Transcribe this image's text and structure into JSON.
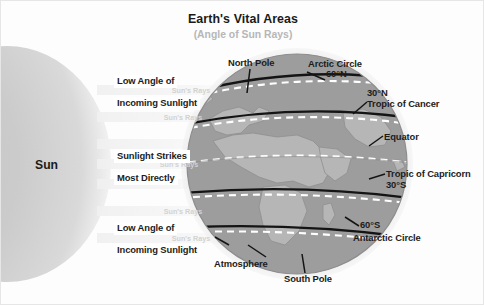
{
  "header": {
    "title": "Earth's Vital Areas",
    "subtitle": "(Angle of Sun Rays)"
  },
  "sun": {
    "label": "Sun"
  },
  "rays": {
    "beam_label_top": "Sun's Rays",
    "beam_label_upper_mid": "Sun's Rays",
    "beam_label_mid": "Sun's Rays",
    "beam_label_lower_mid": "Sun's Rays",
    "beam_label_bottom": "Sun's Rays"
  },
  "left_labels": {
    "top_line1": "Low Angle of",
    "top_line2": "Incoming Sunlight",
    "mid_line1": "Sunlight Strikes",
    "mid_line2": "Most Directly",
    "bottom_line1": "Low Angle of",
    "bottom_line2": "Incoming Sunlight"
  },
  "globe_labels": {
    "north_pole": "North Pole",
    "south_pole": "South Pole",
    "atmosphere": "Atmosphere",
    "arctic_circle": "Arctic Circle",
    "arctic_circle_lat": "60°N",
    "tropic_cancer_lat": "30°N",
    "tropic_cancer": "Tropic of Cancer",
    "equator": "Equator",
    "tropic_capricorn": "Tropic of Capricorn",
    "tropic_capricorn_lat": "30°S",
    "antarctic_lat": "60°S",
    "antarctic_circle": "Antarctic Circle"
  },
  "colors": {
    "title": "#1a1a1a",
    "subtitle": "#b7b7b7",
    "ray_text": "#d2d2d2",
    "ocean": "#9a9a9a",
    "land": "#b4b4b4",
    "atmosphere": "#d6d6d6",
    "sun_core": "#c9c9c9",
    "latitude_line": "#ffffff",
    "band_line": "#1a1a1a",
    "background": "#fdfdfd"
  }
}
